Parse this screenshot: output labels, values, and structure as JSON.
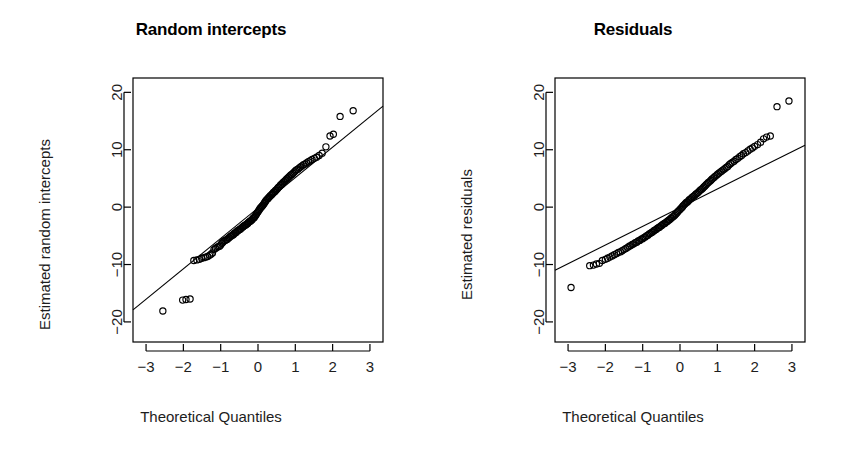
{
  "figure": {
    "background": "#ffffff",
    "foreground": "#000000",
    "width": 844,
    "height": 475
  },
  "panels": [
    {
      "key": "random_intercepts",
      "title": "Random intercepts",
      "xlabel": "Theoretical Quantiles",
      "ylabel": "Estimated random intercepts"
    },
    {
      "key": "residuals",
      "title": "Residuals",
      "xlabel": "Theoretical Quantiles",
      "ylabel": "Estimated residuals"
    }
  ],
  "chart_data": [
    {
      "type": "scatter",
      "subtype": "qq-plot",
      "title": "Random intercepts",
      "xlabel": "Theoretical Quantiles",
      "ylabel": "Estimated random intercepts",
      "xlim": [
        -3.35,
        3.35
      ],
      "ylim": [
        -23.5,
        22.5
      ],
      "xticks": [
        -3,
        -2,
        -1,
        0,
        1,
        2,
        3
      ],
      "xtick_labels": [
        "-3",
        "-2",
        "-1",
        "0",
        "1",
        "2",
        "3"
      ],
      "yticks": [
        -20,
        -10,
        0,
        10,
        20
      ],
      "ytick_labels": [
        "-20",
        "-10",
        "0",
        "10",
        "20"
      ],
      "grid": false,
      "legend": null,
      "reference_line": {
        "name": "qqline",
        "x": [
          -3.35,
          3.35
        ],
        "y": [
          -17.9,
          17.6
        ],
        "slope": 5.3,
        "intercept": -0.15,
        "color": "#000000"
      },
      "marker": {
        "shape": "open-circle",
        "radius": 3.1,
        "stroke": "#000000",
        "fill": "none"
      },
      "points": [
        [
          -2.55,
          -18.1
        ],
        [
          -2.02,
          -16.2
        ],
        [
          -1.93,
          -16.1
        ],
        [
          -1.82,
          -16.0
        ],
        [
          -1.72,
          -9.3
        ],
        [
          -1.64,
          -9.2
        ],
        [
          -1.57,
          -9.1
        ],
        [
          -1.51,
          -8.9
        ],
        [
          -1.45,
          -8.8
        ],
        [
          -1.4,
          -8.7
        ],
        [
          -1.35,
          -8.6
        ],
        [
          -1.3,
          -8.4
        ],
        [
          -1.26,
          -8.2
        ],
        [
          -1.22,
          -8.0
        ],
        [
          -1.18,
          -7.4
        ],
        [
          -1.14,
          -7.2
        ],
        [
          -1.1,
          -7.0
        ],
        [
          -1.07,
          -6.9
        ],
        [
          -1.03,
          -6.8
        ],
        [
          -1.0,
          -6.6
        ],
        [
          -0.97,
          -6.3
        ],
        [
          -0.94,
          -6.1
        ],
        [
          -0.91,
          -5.9
        ],
        [
          -0.88,
          -5.8
        ],
        [
          -0.85,
          -5.7
        ],
        [
          -0.82,
          -5.6
        ],
        [
          -0.79,
          -5.4
        ],
        [
          -0.77,
          -5.3
        ],
        [
          -0.74,
          -5.1
        ],
        [
          -0.71,
          -5.0
        ],
        [
          -0.69,
          -4.9
        ],
        [
          -0.66,
          -4.8
        ],
        [
          -0.64,
          -4.6
        ],
        [
          -0.61,
          -4.5
        ],
        [
          -0.59,
          -4.4
        ],
        [
          -0.56,
          -4.2
        ],
        [
          -0.54,
          -4.1
        ],
        [
          -0.52,
          -4.0
        ],
        [
          -0.49,
          -3.9
        ],
        [
          -0.47,
          -3.8
        ],
        [
          -0.45,
          -3.7
        ],
        [
          -0.42,
          -3.5
        ],
        [
          -0.4,
          -3.4
        ],
        [
          -0.38,
          -3.3
        ],
        [
          -0.36,
          -3.2
        ],
        [
          -0.33,
          -3.1
        ],
        [
          -0.31,
          -3.0
        ],
        [
          -0.29,
          -2.9
        ],
        [
          -0.27,
          -2.8
        ],
        [
          -0.25,
          -2.6
        ],
        [
          -0.22,
          -2.5
        ],
        [
          -0.2,
          -2.4
        ],
        [
          -0.18,
          -2.3
        ],
        [
          -0.16,
          -2.2
        ],
        [
          -0.14,
          -2.0
        ],
        [
          -0.12,
          -1.9
        ],
        [
          -0.1,
          -1.8
        ],
        [
          -0.08,
          -1.6
        ],
        [
          -0.06,
          -1.4
        ],
        [
          -0.04,
          -1.2
        ],
        [
          -0.02,
          -1.0
        ],
        [
          0.0,
          -0.8
        ],
        [
          0.02,
          -0.6
        ],
        [
          0.04,
          -0.4
        ],
        [
          0.06,
          -0.2
        ],
        [
          0.08,
          -0.05
        ],
        [
          0.1,
          0.1
        ],
        [
          0.12,
          0.25
        ],
        [
          0.14,
          0.4
        ],
        [
          0.16,
          0.6
        ],
        [
          0.18,
          0.8
        ],
        [
          0.2,
          1.0
        ],
        [
          0.22,
          1.2
        ],
        [
          0.25,
          1.4
        ],
        [
          0.27,
          1.5
        ],
        [
          0.29,
          1.7
        ],
        [
          0.31,
          1.8
        ],
        [
          0.33,
          2.0
        ],
        [
          0.36,
          2.1
        ],
        [
          0.38,
          2.3
        ],
        [
          0.4,
          2.4
        ],
        [
          0.42,
          2.6
        ],
        [
          0.45,
          2.7
        ],
        [
          0.47,
          2.9
        ],
        [
          0.49,
          3.0
        ],
        [
          0.52,
          3.2
        ],
        [
          0.54,
          3.4
        ],
        [
          0.56,
          3.5
        ],
        [
          0.59,
          3.7
        ],
        [
          0.61,
          3.9
        ],
        [
          0.64,
          4.0
        ],
        [
          0.66,
          4.2
        ],
        [
          0.69,
          4.4
        ],
        [
          0.71,
          4.5
        ],
        [
          0.74,
          4.7
        ],
        [
          0.77,
          4.9
        ],
        [
          0.79,
          5.0
        ],
        [
          0.82,
          5.2
        ],
        [
          0.85,
          5.4
        ],
        [
          0.88,
          5.6
        ],
        [
          0.91,
          5.7
        ],
        [
          0.94,
          5.9
        ],
        [
          0.97,
          6.1
        ],
        [
          1.0,
          6.3
        ],
        [
          1.03,
          6.5
        ],
        [
          1.07,
          6.6
        ],
        [
          1.1,
          6.8
        ],
        [
          1.14,
          7.0
        ],
        [
          1.18,
          7.2
        ],
        [
          1.22,
          7.4
        ],
        [
          1.26,
          7.5
        ],
        [
          1.3,
          7.7
        ],
        [
          1.35,
          7.9
        ],
        [
          1.4,
          8.1
        ],
        [
          1.45,
          8.3
        ],
        [
          1.51,
          8.5
        ],
        [
          1.57,
          8.7
        ],
        [
          1.64,
          9.0
        ],
        [
          1.72,
          9.4
        ],
        [
          1.82,
          10.5
        ],
        [
          1.93,
          12.4
        ],
        [
          2.02,
          12.7
        ],
        [
          2.2,
          15.8
        ],
        [
          2.55,
          16.8
        ]
      ]
    },
    {
      "type": "scatter",
      "subtype": "qq-plot",
      "title": "Residuals",
      "xlabel": "Theoretical Quantiles",
      "ylabel": "Estimated residuals",
      "xlim": [
        -3.35,
        3.35
      ],
      "ylim": [
        -23.5,
        22.5
      ],
      "xticks": [
        -3,
        -2,
        -1,
        0,
        1,
        2,
        3
      ],
      "xtick_labels": [
        "-3",
        "-2",
        "-1",
        "0",
        "1",
        "2",
        "3"
      ],
      "yticks": [
        -20,
        -10,
        0,
        10,
        20
      ],
      "ytick_labels": [
        "-20",
        "-10",
        "0",
        "10",
        "20"
      ],
      "grid": false,
      "legend": null,
      "reference_line": {
        "name": "qqline",
        "x": [
          -3.35,
          3.35
        ],
        "y": [
          -11.0,
          10.8
        ],
        "slope": 3.25,
        "intercept": -0.1,
        "color": "#000000"
      },
      "marker": {
        "shape": "open-circle",
        "radius": 3.1,
        "stroke": "#000000",
        "fill": "none"
      },
      "points": [
        [
          -2.92,
          -14.0
        ],
        [
          -2.42,
          -10.2
        ],
        [
          -2.32,
          -10.1
        ],
        [
          -2.24,
          -9.9
        ],
        [
          -2.16,
          -9.8
        ],
        [
          -2.08,
          -9.3
        ],
        [
          -2.0,
          -9.1
        ],
        [
          -1.94,
          -8.9
        ],
        [
          -1.88,
          -8.7
        ],
        [
          -1.82,
          -8.5
        ],
        [
          -1.76,
          -8.3
        ],
        [
          -1.7,
          -8.1
        ],
        [
          -1.65,
          -7.9
        ],
        [
          -1.6,
          -7.8
        ],
        [
          -1.55,
          -7.6
        ],
        [
          -1.5,
          -7.4
        ],
        [
          -1.45,
          -7.2
        ],
        [
          -1.4,
          -7.0
        ],
        [
          -1.36,
          -6.8
        ],
        [
          -1.32,
          -6.7
        ],
        [
          -1.28,
          -6.5
        ],
        [
          -1.24,
          -6.4
        ],
        [
          -1.2,
          -6.2
        ],
        [
          -1.16,
          -6.1
        ],
        [
          -1.12,
          -5.9
        ],
        [
          -1.08,
          -5.8
        ],
        [
          -1.04,
          -5.6
        ],
        [
          -1.0,
          -5.5
        ],
        [
          -0.97,
          -5.3
        ],
        [
          -0.93,
          -5.2
        ],
        [
          -0.9,
          -5.0
        ],
        [
          -0.86,
          -4.9
        ],
        [
          -0.83,
          -4.7
        ],
        [
          -0.8,
          -4.6
        ],
        [
          -0.76,
          -4.4
        ],
        [
          -0.73,
          -4.3
        ],
        [
          -0.7,
          -4.1
        ],
        [
          -0.67,
          -4.0
        ],
        [
          -0.64,
          -3.9
        ],
        [
          -0.61,
          -3.7
        ],
        [
          -0.58,
          -3.6
        ],
        [
          -0.55,
          -3.5
        ],
        [
          -0.52,
          -3.3
        ],
        [
          -0.49,
          -3.2
        ],
        [
          -0.46,
          -3.0
        ],
        [
          -0.43,
          -2.9
        ],
        [
          -0.4,
          -2.8
        ],
        [
          -0.37,
          -2.6
        ],
        [
          -0.34,
          -2.5
        ],
        [
          -0.31,
          -2.3
        ],
        [
          -0.28,
          -2.2
        ],
        [
          -0.25,
          -2.0
        ],
        [
          -0.23,
          -1.9
        ],
        [
          -0.2,
          -1.7
        ],
        [
          -0.17,
          -1.6
        ],
        [
          -0.14,
          -1.4
        ],
        [
          -0.11,
          -1.2
        ],
        [
          -0.08,
          -1.0
        ],
        [
          -0.06,
          -0.8
        ],
        [
          -0.03,
          -0.6
        ],
        [
          0.0,
          -0.4
        ],
        [
          0.03,
          -0.2
        ],
        [
          0.06,
          0.0
        ],
        [
          0.08,
          0.2
        ],
        [
          0.11,
          0.4
        ],
        [
          0.14,
          0.6
        ],
        [
          0.17,
          0.8
        ],
        [
          0.2,
          0.9
        ],
        [
          0.23,
          1.1
        ],
        [
          0.25,
          1.3
        ],
        [
          0.28,
          1.4
        ],
        [
          0.31,
          1.6
        ],
        [
          0.34,
          1.8
        ],
        [
          0.37,
          1.9
        ],
        [
          0.4,
          2.1
        ],
        [
          0.43,
          2.3
        ],
        [
          0.46,
          2.4
        ],
        [
          0.49,
          2.6
        ],
        [
          0.52,
          2.8
        ],
        [
          0.55,
          3.0
        ],
        [
          0.58,
          3.1
        ],
        [
          0.61,
          3.3
        ],
        [
          0.64,
          3.5
        ],
        [
          0.67,
          3.7
        ],
        [
          0.7,
          3.9
        ],
        [
          0.73,
          4.1
        ],
        [
          0.76,
          4.3
        ],
        [
          0.8,
          4.5
        ],
        [
          0.83,
          4.7
        ],
        [
          0.86,
          4.9
        ],
        [
          0.9,
          5.1
        ],
        [
          0.93,
          5.3
        ],
        [
          0.97,
          5.5
        ],
        [
          1.0,
          5.7
        ],
        [
          1.04,
          5.9
        ],
        [
          1.08,
          6.1
        ],
        [
          1.12,
          6.3
        ],
        [
          1.16,
          6.5
        ],
        [
          1.2,
          6.7
        ],
        [
          1.24,
          6.9
        ],
        [
          1.28,
          7.1
        ],
        [
          1.32,
          7.4
        ],
        [
          1.36,
          7.6
        ],
        [
          1.4,
          7.8
        ],
        [
          1.45,
          8.0
        ],
        [
          1.5,
          8.3
        ],
        [
          1.55,
          8.5
        ],
        [
          1.6,
          8.8
        ],
        [
          1.65,
          9.0
        ],
        [
          1.7,
          9.3
        ],
        [
          1.76,
          9.5
        ],
        [
          1.82,
          9.8
        ],
        [
          1.88,
          10.1
        ],
        [
          1.94,
          10.3
        ],
        [
          2.0,
          10.6
        ],
        [
          2.08,
          10.9
        ],
        [
          2.16,
          11.3
        ],
        [
          2.24,
          11.9
        ],
        [
          2.32,
          12.2
        ],
        [
          2.42,
          12.4
        ],
        [
          2.6,
          17.5
        ],
        [
          2.92,
          18.5
        ]
      ]
    }
  ],
  "axes_geometry": {
    "plot_box": {
      "left": 133,
      "top": 78,
      "right": 383,
      "bottom": 342
    },
    "xtick_pixels": [
      143,
      184,
      225,
      266,
      307,
      348,
      377
    ],
    "ytick_pixels": [
      329,
      270,
      211,
      152,
      93
    ]
  }
}
